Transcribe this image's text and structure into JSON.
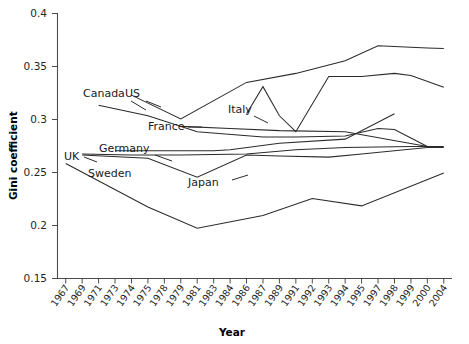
{
  "chart_data": {
    "type": "line",
    "title": "",
    "xlabel": "Year",
    "ylabel": "Gini coefficient",
    "grid": false,
    "legend_position": "inline-labels",
    "ylim": [
      0.15,
      0.4
    ],
    "ytick_labels": [
      "0.4",
      "0.35",
      "0.3",
      "0.25",
      "0.2",
      "0.15"
    ],
    "ytick_values": [
      0.4,
      0.35,
      0.3,
      0.25,
      0.2,
      0.15
    ],
    "categories": [
      "1967",
      "1969",
      "1971",
      "1973",
      "1974",
      "1975",
      "1978",
      "1979",
      "1981",
      "1983",
      "1984",
      "1986",
      "1987",
      "1989",
      "1991",
      "1992",
      "1993",
      "1994",
      "1995",
      "1997",
      "1998",
      "1999",
      "2000",
      "2004"
    ],
    "series": [
      {
        "name": "US",
        "label": "US",
        "points": [
          {
            "x": "1974",
            "y": 0.323
          },
          {
            "x": "1979",
            "y": 0.3005
          },
          {
            "x": "1986",
            "y": 0.335
          },
          {
            "x": "1991",
            "y": 0.3435
          },
          {
            "x": "1994",
            "y": 0.3555
          },
          {
            "x": "1997",
            "y": 0.3695
          },
          {
            "x": "2000",
            "y": 0.3675
          },
          {
            "x": "2004",
            "y": 0.367
          }
        ]
      },
      {
        "name": "Canada",
        "label": "Canada",
        "points": [
          {
            "x": "1971",
            "y": 0.3135
          },
          {
            "x": "1975",
            "y": 0.3035
          },
          {
            "x": "1981",
            "y": 0.2885
          },
          {
            "x": "1987",
            "y": 0.2835
          },
          {
            "x": "1991",
            "y": 0.2835
          },
          {
            "x": "1994",
            "y": 0.2845
          },
          {
            "x": "1997",
            "y": 0.2915
          },
          {
            "x": "1998",
            "y": 0.2905
          },
          {
            "x": "2000",
            "y": 0.2745
          }
        ]
      },
      {
        "name": "Italy",
        "label": "Italy",
        "points": [
          {
            "x": "1986",
            "y": 0.3055
          },
          {
            "x": "1987",
            "y": 0.331
          },
          {
            "x": "1989",
            "y": 0.3035
          },
          {
            "x": "1991",
            "y": 0.2885
          },
          {
            "x": "1993",
            "y": 0.3405
          },
          {
            "x": "1995",
            "y": 0.3405
          },
          {
            "x": "1998",
            "y": 0.3435
          },
          {
            "x": "1999",
            "y": 0.3415
          },
          {
            "x": "2004",
            "y": 0.3305
          }
        ]
      },
      {
        "name": "France",
        "label": "France",
        "points": [
          {
            "x": "1979",
            "y": 0.2935
          },
          {
            "x": "1984",
            "y": 0.2915
          },
          {
            "x": "1989",
            "y": 0.2895
          },
          {
            "x": "1994",
            "y": 0.2885
          },
          {
            "x": "2000",
            "y": 0.2745
          }
        ]
      },
      {
        "name": "Germany",
        "label": "Germany",
        "points": [
          {
            "x": "1973",
            "y": 0.2705
          },
          {
            "x": "1978",
            "y": 0.2705
          },
          {
            "x": "1983",
            "y": 0.2705
          },
          {
            "x": "1984",
            "y": 0.2715
          },
          {
            "x": "1989",
            "y": 0.2775
          },
          {
            "x": "1994",
            "y": 0.2815
          },
          {
            "x": "1998",
            "y": 0.3055
          }
        ]
      },
      {
        "name": "UK",
        "label": "UK",
        "points": [
          {
            "x": "1969",
            "y": 0.2675
          },
          {
            "x": "1974",
            "y": 0.2665
          },
          {
            "x": "1979",
            "y": 0.2665
          },
          {
            "x": "1986",
            "y": 0.2675
          },
          {
            "x": "1991",
            "y": 0.2715
          },
          {
            "x": "1994",
            "y": 0.2735
          },
          {
            "x": "1999",
            "y": 0.2745
          },
          {
            "x": "2004",
            "y": 0.2745
          }
        ]
      },
      {
        "name": "Japan",
        "label": "Japan",
        "points": [
          {
            "x": "1969",
            "y": 0.2665
          },
          {
            "x": "1975",
            "y": 0.2635
          },
          {
            "x": "1981",
            "y": 0.2455
          },
          {
            "x": "1986",
            "y": 0.2665
          },
          {
            "x": "1989",
            "y": 0.2655
          },
          {
            "x": "1993",
            "y": 0.2645
          },
          {
            "x": "1995",
            "y": 0.2675
          },
          {
            "x": "2000",
            "y": 0.2735
          },
          {
            "x": "2004",
            "y": 0.2735
          }
        ]
      },
      {
        "name": "Sweden",
        "label": "Sweden",
        "points": [
          {
            "x": "1967",
            "y": 0.2585
          },
          {
            "x": "1975",
            "y": 0.2175
          },
          {
            "x": "1981",
            "y": 0.1975
          },
          {
            "x": "1987",
            "y": 0.2095
          },
          {
            "x": "1992",
            "y": 0.2255
          },
          {
            "x": "1995",
            "y": 0.2185
          },
          {
            "x": "2004",
            "y": 0.2495
          }
        ]
      }
    ]
  },
  "labels": {
    "canada": "Canada",
    "us": "US",
    "italy": "Italy",
    "france": "France",
    "germany": "Germany",
    "uk": "UK",
    "sweden": "Sweden",
    "japan": "Japan",
    "y_axis_title": "Gini coefficient",
    "x_axis_title": "Year"
  },
  "colors": {
    "line": "#2b2b2b",
    "axis": "#4b4b4b",
    "text": "#1a1a1a",
    "background": "#ffffff"
  }
}
